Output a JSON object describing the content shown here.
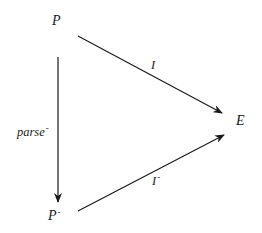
{
  "diagram": {
    "type": "commutative-triangle",
    "nodes": [
      {
        "id": "P",
        "label": "P",
        "superscript": ""
      },
      {
        "id": "P_minus",
        "label": "P",
        "superscript": "-"
      },
      {
        "id": "E",
        "label": "E",
        "superscript": ""
      }
    ],
    "edges": [
      {
        "from": "P",
        "to": "E",
        "label": "I",
        "superscript": ""
      },
      {
        "from": "P",
        "to": "P_minus",
        "label": "parse",
        "superscript": "-"
      },
      {
        "from": "P_minus",
        "to": "E",
        "label": "I",
        "superscript": "-"
      }
    ],
    "colors": {
      "ink": "#1a1a1a",
      "background": "#ffffff"
    }
  }
}
